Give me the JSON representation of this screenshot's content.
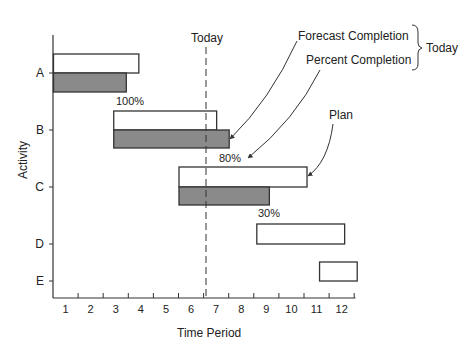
{
  "chart_data": {
    "type": "gantt",
    "title": "",
    "xlabel": "Time Period",
    "ylabel": "Activity",
    "x_ticks": [
      "1",
      "2",
      "3",
      "4",
      "5",
      "6",
      "7",
      "8",
      "9",
      "10",
      "11",
      "12"
    ],
    "xlim": [
      0,
      12
    ],
    "activities": [
      "A",
      "B",
      "C",
      "D",
      "E"
    ],
    "today_marker": {
      "label": "Today",
      "x": 6.1
    },
    "series": [
      {
        "name": "Plan",
        "style": "open",
        "bars": [
          {
            "activity": "A",
            "start": 0.0,
            "end": 3.4
          },
          {
            "activity": "B",
            "start": 2.4,
            "end": 6.5
          },
          {
            "activity": "C",
            "start": 5.0,
            "end": 10.1
          },
          {
            "activity": "D",
            "start": 8.1,
            "end": 11.6
          },
          {
            "activity": "E",
            "start": 10.6,
            "end": 12.1
          }
        ]
      },
      {
        "name": "Actual / Forecast",
        "style": "shaded",
        "bars": [
          {
            "activity": "A",
            "start": 0.0,
            "end": 2.9
          },
          {
            "activity": "B",
            "start": 2.4,
            "end": 7.0
          },
          {
            "activity": "C",
            "start": 5.0,
            "end": 8.6
          }
        ]
      }
    ],
    "percent_labels": [
      {
        "activity": "A",
        "text": "100%"
      },
      {
        "activity": "B",
        "text": "80%"
      },
      {
        "activity": "C",
        "text": "30%"
      }
    ],
    "annotations": [
      {
        "text": "Forecast Completion"
      },
      {
        "text": "Percent Completion"
      },
      {
        "text": "Today"
      },
      {
        "text": "Plan"
      }
    ],
    "grid": false,
    "legend": "none"
  },
  "labels": {
    "today_top": "Today",
    "forecast": "Forecast Completion",
    "percent": "Percent Completion",
    "today_brace": "Today",
    "plan": "Plan",
    "pct_a": "100%",
    "pct_b": "80%",
    "pct_c": "30%",
    "xlabel": "Time Period",
    "ylabel": "Activity"
  },
  "colors": {
    "shaded": "#8a8a8a",
    "line": "#333333"
  }
}
